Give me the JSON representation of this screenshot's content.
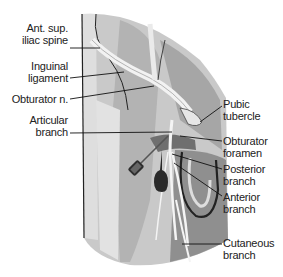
{
  "figure": {
    "labels_left": [
      {
        "id": "asis",
        "line1": "Ant. sup.",
        "line2": "iliac spine"
      },
      {
        "id": "inguinal",
        "line1": "Inguinal",
        "line2": "ligament"
      },
      {
        "id": "obturator-n",
        "line1": "Obturator n.",
        "line2": ""
      },
      {
        "id": "articular",
        "line1": "Articular",
        "line2": "branch"
      }
    ],
    "labels_right": [
      {
        "id": "pubic-tubercle",
        "line1": "Pubic",
        "line2": "tubercle"
      },
      {
        "id": "obturator-foramen",
        "line1": "Obturator",
        "line2": "foramen"
      },
      {
        "id": "posterior-branch",
        "line1": "Posterior",
        "line2": "branch"
      },
      {
        "id": "anterior-branch",
        "line1": "Anterior",
        "line2": "branch"
      },
      {
        "id": "cutaneous-branch",
        "line1": "Cutaneous",
        "line2": "branch"
      }
    ],
    "colors": {
      "skin_light": "#d4d4d4",
      "skin_mid": "#b9b9b9",
      "skin_dark": "#9a9a9a",
      "ligament": "#eeeeee",
      "outline": "#222222",
      "needle_hub": "#333333"
    }
  }
}
